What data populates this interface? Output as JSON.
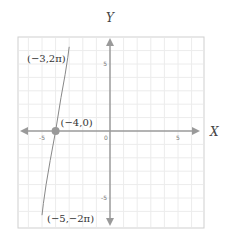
{
  "chart_data": {
    "type": "line",
    "title": "",
    "xlabel": "X",
    "ylabel": "Y",
    "xlim": [
      -7,
      7
    ],
    "ylim": [
      -7,
      7
    ],
    "grid": true,
    "grid_step": 1,
    "x_ticks": [
      {
        "value": -5,
        "label": "-5"
      },
      {
        "value": 0,
        "label": "0"
      },
      {
        "value": 5,
        "label": "5"
      }
    ],
    "y_ticks": [
      {
        "value": 5,
        "label": "5"
      },
      {
        "value": -5,
        "label": "-5"
      }
    ],
    "series": [
      {
        "name": "curve",
        "color": "#888888",
        "points": [
          {
            "x": -3,
            "y": 6.283
          },
          {
            "x": -3.1,
            "y": 5.5
          },
          {
            "x": -3.3,
            "y": 4.2
          },
          {
            "x": -3.6,
            "y": 2.5
          },
          {
            "x": -4,
            "y": 0
          },
          {
            "x": -4.4,
            "y": -2.2
          },
          {
            "x": -4.7,
            "y": -4.0
          },
          {
            "x": -4.9,
            "y": -5.4
          },
          {
            "x": -5,
            "y": -6.283
          }
        ]
      }
    ],
    "highlight_points": [
      {
        "x": -4,
        "y": 0,
        "label": "(−4,0)"
      }
    ],
    "annotations": [
      {
        "x": -3,
        "y": 6.283,
        "label": "(−3,2π)"
      },
      {
        "x": -5,
        "y": -6.283,
        "label": "(−5,−2π)"
      }
    ],
    "colors": {
      "axis": "#9a9a9a",
      "grid": "#ececec",
      "frame": "#cfcfcf",
      "curve": "#888888",
      "point": "#999999"
    }
  }
}
